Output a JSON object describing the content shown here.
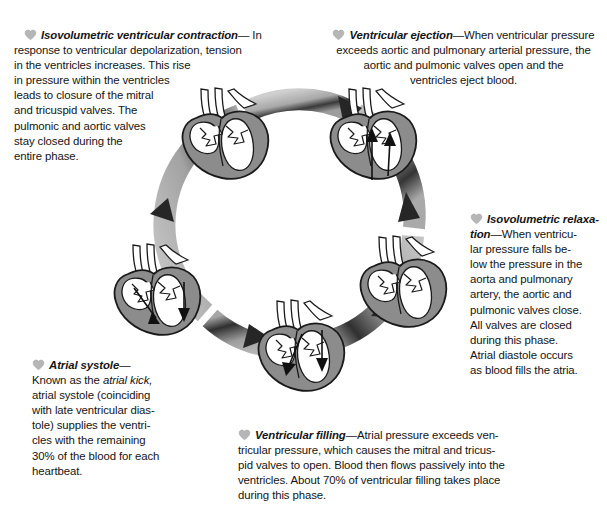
{
  "figure": {
    "background_color": "#ffffff",
    "text_color": "#141414",
    "ring_color_light": "#b9b9b9",
    "ring_color_mid": "#9a9a9a",
    "ring_color_dark": "#2b2b2b",
    "heart_muscle_color": "#8c8c8c",
    "heart_outline_color": "#1a1a1a",
    "chamber_fill_color": "#ffffff",
    "bullet_icon": "heart-icon"
  },
  "phases": [
    {
      "id": "isovolumetric-ventricular-contraction",
      "lead": "Isovolumetric ventricular contraction",
      "dash": "—",
      "body": "In response to ventricular depolarization, tension in the ventricles increases. This rise in pressure within the ventricles leads to closure of the mitral and tricuspid valves. The pulmonic and aortic valves stay closed during the entire phase.",
      "lines": [
        "Isovolumetric ventricular contraction— In",
        "response to ventricular depolarization, tension",
        "in the ventricles increases. This rise",
        "in pressure within the ventricles",
        "leads to closure of the mitral",
        "and tricuspid valves. The",
        "pulmonic and aortic valves",
        "stay closed during the",
        "entire phase."
      ]
    },
    {
      "id": "ventricular-ejection",
      "lead": "Ventricular ejection",
      "dash": "—",
      "body": "When ventricular pressure exceeds aortic and pulmonary arterial pressure, the aortic and pulmonic valves open and the ventricles eject blood.",
      "lines": [
        "Ventricular ejection—When ventricular pressure",
        "exceeds aortic and pulmonary arterial pressure, the",
        "aortic and pulmonic valves open and the",
        "ventricles eject blood."
      ]
    },
    {
      "id": "isovolumetric-relaxation",
      "lead": "Isovolumetric relaxa-tion",
      "dash": "—",
      "body": "When ventricular pressure falls below the pressure in the aorta and pulmonary artery, the aortic and pulmonic valves close. All valves are closed during this phase. Atrial diastole occurs as blood fills the atria.",
      "lines": [
        "Isovolumetric relaxa-",
        "tion—When ventricu-",
        "lar pressure falls be-",
        "low the pressure in the",
        "aorta and pulmonary",
        "artery, the aortic and",
        "pulmonic valves close.",
        "All valves are closed",
        "during this phase.",
        "Atrial diastole occurs",
        "as blood fills the atria."
      ]
    },
    {
      "id": "ventricular-filling",
      "lead": "Ventricular filling",
      "dash": "—",
      "body": "Atrial pressure exceeds ventricular pressure, which causes the mitral and tricuspid valves to open. Blood then flows passively into the ventricles. About 70% of ventricular filling takes place during this phase.",
      "lines": [
        "Ventricular filling—Atrial pressure exceeds ven-",
        "tricular pressure, which causes the mitral and tricus-",
        "pid valves to open. Blood then flows passively into the",
        "ventricles. About 70% of ventricular filling takes place",
        "during this phase."
      ],
      "percent": "70%"
    },
    {
      "id": "atrial-systole",
      "lead": "Atrial systole",
      "dash": "—",
      "body": "Known as the atrial kick, atrial systole (coinciding with late ventricular diastole) supplies the ventricles with the remaining 30% of the blood for each heartbeat.",
      "emphasis": "atrial kick,",
      "lines": [
        "Atrial systole—",
        "Known as the atrial kick,",
        "atrial systole (coinciding",
        "with late ventricular dias-",
        "tole) supplies the ventri-",
        "cles with the remaining",
        "30% of the blood for each",
        "heartbeat."
      ],
      "percent": "30%"
    }
  ],
  "text": {
    "ivc": {
      "l1a": "Isovolumetric ventricular contraction",
      "l1b": "— In",
      "l2": "response to ventricular depolarization, tension",
      "l3": "in the ventricles increases. This rise",
      "l4": "in pressure within the ventricles",
      "l5": "leads to closure of the mitral",
      "l6": "and tricuspid valves. The",
      "l7": "pulmonic and aortic valves",
      "l8": "stay closed during the",
      "l9": "entire phase."
    },
    "ve": {
      "l1a": "Ventricular ejection",
      "l1b": "—When ventricular pressure",
      "l2": "exceeds aortic and pulmonary arterial pressure, the",
      "l3": "aortic and pulmonic valves open and the",
      "l4": "ventricles eject blood."
    },
    "ir": {
      "l1a": "Isovolumetric relaxa-",
      "l2a": "tion",
      "l2b": "—When ventricu-",
      "l3": "lar pressure falls be-",
      "l4": "low the pressure in the",
      "l5": "aorta and pulmonary",
      "l6": "artery, the aortic and",
      "l7": "pulmonic valves close.",
      "l8": "All valves are closed",
      "l9": "during this phase.",
      "l10": "Atrial diastole occurs",
      "l11": "as blood fills the atria."
    },
    "vf": {
      "l1a": "Ventricular filling",
      "l1b": "—Atrial pressure exceeds ven-",
      "l2": "tricular pressure, which causes the mitral and tricus-",
      "l3": "pid valves to open. Blood then flows passively into the",
      "l4": "ventricles. About 70% of ventricular filling takes place",
      "l5": "during this phase."
    },
    "as": {
      "l1a": "Atrial systole",
      "l1b": "—",
      "l2a": "Known as the ",
      "l2b": "atrial kick,",
      "l3": "atrial systole (coinciding",
      "l4": "with late ventricular dias-",
      "l5": "tole) supplies the ventri-",
      "l6": "cles with the remaining",
      "l7": "30% of the blood for each",
      "l8": "heartbeat."
    }
  },
  "hearts": [
    {
      "id": "heart-ivc",
      "position": "top-left",
      "arrows": []
    },
    {
      "id": "heart-ve",
      "position": "top-right",
      "arrows": [
        "up-aortic",
        "up-pulmonic"
      ]
    },
    {
      "id": "heart-ir",
      "position": "right",
      "arrows": []
    },
    {
      "id": "heart-vf",
      "position": "bottom",
      "arrows": [
        "down-left",
        "down-right"
      ]
    },
    {
      "id": "heart-as",
      "position": "left",
      "arrows": [
        "down-left",
        "down-right"
      ]
    }
  ],
  "ring": {
    "arrowheads": 5,
    "direction": "clockwise"
  }
}
